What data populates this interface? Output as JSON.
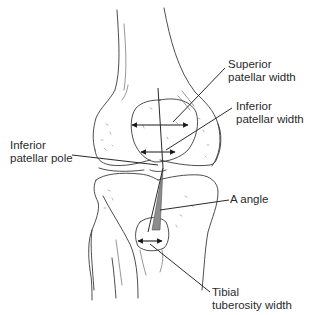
{
  "figure": {
    "background": "#ffffff",
    "line_color": "#3a3a3a",
    "a_angle_fill": "#8c8c8c"
  },
  "labels": {
    "superior_patellar_width": {
      "line1": "Superior",
      "line2": "patellar width"
    },
    "inferior_patellar_width": {
      "line1": "Inferior",
      "line2": "patellar width"
    },
    "inferior_patellar_pole": {
      "line1": "Inferior",
      "line2": "patellar pole"
    },
    "a_angle": {
      "line1": "A angle"
    },
    "tibial_tuberosity_width": {
      "line1": "Tibial",
      "line2": "tuberosity width"
    }
  }
}
